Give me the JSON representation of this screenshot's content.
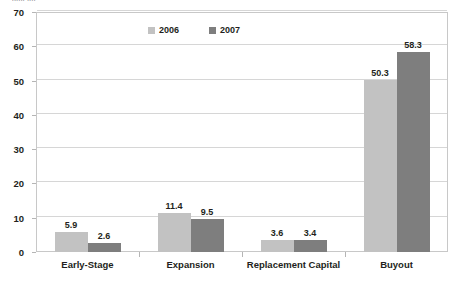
{
  "chart_data": {
    "type": "bar",
    "title": "",
    "title_fragment": "......  ....",
    "xlabel": "",
    "ylabel": "",
    "categories": [
      "Early-Stage",
      "Expansion",
      "Replacement Capital",
      "Buyout"
    ],
    "series": [
      {
        "name": "2006",
        "values": [
          5.9,
          11.4,
          3.6,
          50.3
        ],
        "color": "#c2c2c2"
      },
      {
        "name": "2007",
        "values": [
          2.6,
          9.5,
          3.4,
          58.3
        ],
        "color": "#7e7e7e"
      }
    ],
    "ylim": [
      0,
      70
    ],
    "yticks": [
      0,
      10,
      20,
      30,
      40,
      50,
      60,
      70
    ],
    "ytick_labels": [
      "0",
      "10",
      "20",
      "30",
      "40",
      "50",
      "60",
      "70"
    ],
    "grid": true,
    "legend_position": "top-center",
    "data_labels": [
      [
        "5.9",
        "11.4",
        "3.6",
        "50.3"
      ],
      [
        "2.6",
        "9.5",
        "3.4",
        "58.3"
      ]
    ]
  }
}
